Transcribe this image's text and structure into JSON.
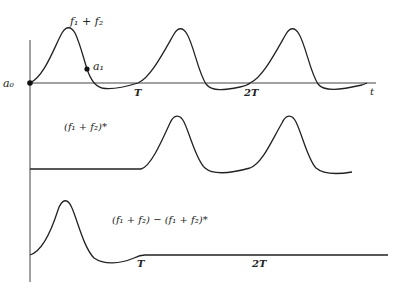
{
  "diagram": {
    "panels": [
      {
        "id": "top",
        "curve_label": "f₁ + f₂",
        "points": [
          {
            "name": "a0",
            "label": "a₀"
          },
          {
            "name": "a1",
            "label": "a₁"
          }
        ],
        "ticks": [
          "T",
          "2T"
        ],
        "axis_label": "t"
      },
      {
        "id": "middle",
        "curve_label": "(f₁ + f₂)*"
      },
      {
        "id": "bottom",
        "curve_label": "(f₁ + f₂) − (f₁ + f₂)*",
        "ticks": [
          "T",
          "2T"
        ]
      }
    ]
  }
}
